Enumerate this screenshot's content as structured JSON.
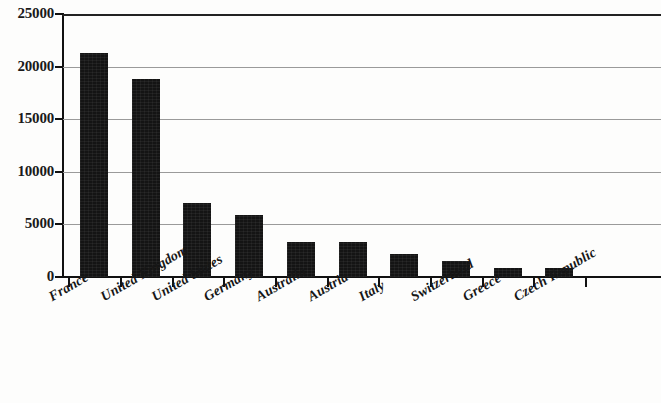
{
  "chart_data": {
    "type": "bar",
    "title": "",
    "xlabel": "",
    "ylabel": "",
    "categories": [
      "France",
      "United Kingdom",
      "United States",
      "Germany",
      "Australia",
      "Austria",
      "Italy",
      "Switzerland",
      "Greece",
      "Czech Republic"
    ],
    "values": [
      21300,
      18800,
      7000,
      5900,
      3300,
      3300,
      2200,
      1500,
      900,
      850
    ],
    "ylim": [
      0,
      25000
    ],
    "ytick_labels": [
      "0",
      "5000",
      "10000",
      "15000",
      "20000",
      "25000"
    ],
    "ytick_values": [
      0,
      5000,
      10000,
      15000,
      20000,
      25000
    ],
    "grid": true,
    "legend": false,
    "bar_color": "#141414",
    "grid_color": "#9a9a9a",
    "axis_color": "#111111",
    "background_color": "#fdfdfc"
  }
}
